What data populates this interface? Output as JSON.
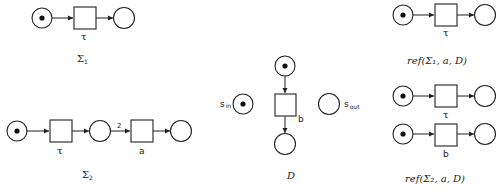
{
  "nets": {
    "sigma1": {
      "transition_label": "τ",
      "caption_main": "Σ",
      "caption_sub": "1"
    },
    "sigma2": {
      "transition1_label": "τ",
      "arc_weight": "2",
      "transition2_label": "a",
      "caption_main": "Σ",
      "caption_sub": "2"
    },
    "D": {
      "transition_label": "b",
      "s_in": "s",
      "s_in_sub": "in",
      "s_out": "s",
      "s_out_sub": "out",
      "caption": "D"
    },
    "ref1": {
      "transition_label": "τ",
      "caption": "ref(Σ₁, a, D)"
    },
    "ref2": {
      "transition1_label": "τ",
      "transition2_label": "b",
      "caption": "ref(Σ₂, a, D)"
    }
  }
}
